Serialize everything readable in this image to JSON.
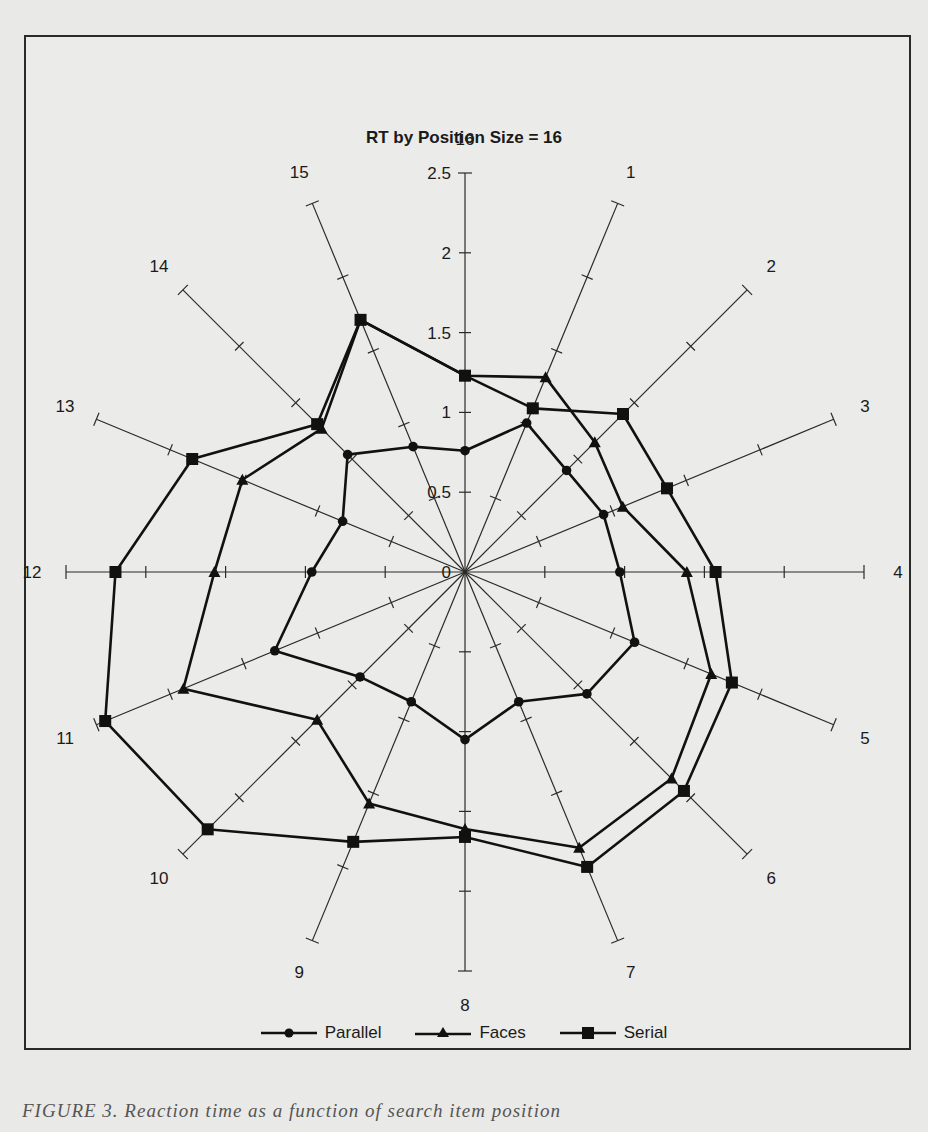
{
  "chart_data": {
    "type": "radar",
    "title": "RT by Position Size = 16",
    "axes": [
      "16",
      "1",
      "2",
      "3",
      "4",
      "5",
      "6",
      "7",
      "8",
      "9",
      "10",
      "11",
      "12",
      "13",
      "14",
      "15"
    ],
    "radial_ticks": [
      "0",
      "0.5",
      "1",
      "1.5",
      "2",
      "2.5"
    ],
    "rlim": [
      0,
      2.5
    ],
    "grid": false,
    "legend_position": "bottom",
    "series": [
      {
        "name": "Parallel",
        "marker": "circle",
        "values": [
          0.76,
          1.01,
          0.9,
          0.94,
          0.97,
          1.15,
          1.08,
          0.88,
          1.05,
          0.88,
          0.93,
          1.29,
          0.96,
          0.83,
          1.04,
          0.85
        ]
      },
      {
        "name": "Faces",
        "marker": "triangle",
        "values": [
          1.23,
          1.32,
          1.15,
          1.07,
          1.39,
          1.67,
          1.83,
          1.87,
          1.61,
          1.57,
          1.31,
          1.91,
          1.57,
          1.51,
          1.27,
          1.71
        ]
      },
      {
        "name": "Serial",
        "marker": "square",
        "values": [
          1.23,
          1.11,
          1.4,
          1.37,
          1.57,
          1.81,
          1.94,
          2.0,
          1.66,
          1.83,
          2.28,
          2.44,
          2.19,
          1.85,
          1.31,
          1.71
        ]
      }
    ]
  },
  "legend": {
    "items": [
      {
        "label": "Parallel",
        "marker": "circle"
      },
      {
        "label": "Faces",
        "marker": "triangle"
      },
      {
        "label": "Serial",
        "marker": "square"
      }
    ]
  },
  "caption": "FIGURE 3. Reaction time as a function of search item position"
}
